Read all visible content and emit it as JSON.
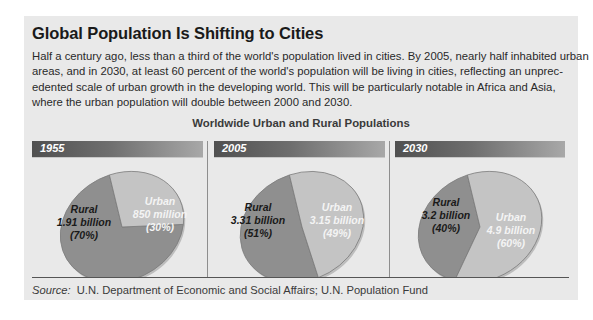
{
  "title": "Global Population Is Shifting to Cities",
  "body_lines": [
    "Half a century ago, less than a third of the world's population lived in cities. By 2005, nearly half inhabited urban",
    "areas, and in 2030, at least 60 percent of the world's population will be living in cities, reflecting an unprec-",
    "edented scale of urban growth in the developing world.  This will be particularly notable in Africa and Asia,",
    "where the urban population will double between 2000 and 2030."
  ],
  "source": {
    "label": "Source:",
    "text": "U.N. Department of Economic and Social Affairs; U.N. Population Fund"
  },
  "colors": {
    "rural": "#8f8f8f",
    "urban": "#c4c4c4",
    "rural_text": "#1a1a1a",
    "urban_text": "#f4f4f4",
    "edge": "#7a7a7a"
  },
  "chart_data": {
    "type": "pie",
    "title": "Worldwide Urban and Rural Populations",
    "charts": [
      {
        "year": "1955",
        "slices": [
          {
            "name": "Rural",
            "value_label": "1.91 billion",
            "percent": 70,
            "percent_label": "(70%)"
          },
          {
            "name": "Urban",
            "value_label": "850 million",
            "percent": 30,
            "percent_label": "(30%)"
          }
        ]
      },
      {
        "year": "2005",
        "slices": [
          {
            "name": "Rural",
            "value_label": "3.31 billion",
            "percent": 51,
            "percent_label": "(51%)"
          },
          {
            "name": "Urban",
            "value_label": "3.15 billion",
            "percent": 49,
            "percent_label": "(49%)"
          }
        ]
      },
      {
        "year": "2030",
        "slices": [
          {
            "name": "Rural",
            "value_label": "3.2 billion",
            "percent": 40,
            "percent_label": "(40%)"
          },
          {
            "name": "Urban",
            "value_label": "4.9 billion",
            "percent": 60,
            "percent_label": "(60%)"
          }
        ]
      }
    ]
  }
}
